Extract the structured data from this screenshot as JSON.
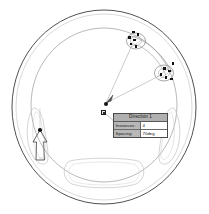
{
  "app": {
    "view_label": "cad-graphics-area",
    "background_color": "#ffffff"
  },
  "callout": {
    "title": "Direction 1",
    "rows": [
      {
        "label": "Instances:",
        "value": "4"
      },
      {
        "label": "Spacing:",
        "value": "70deg"
      }
    ]
  },
  "model": {
    "name": "steering-wheel-part",
    "outer_rim_color": "#3d3d3d",
    "inner_rim_color": "#8e8e8e",
    "grip_color": "#bdbdbd",
    "preview_color": "#9a9a9a",
    "selection_color": "#2d2d2d"
  },
  "icons": {
    "rotation_axis": "rotation-axis-icon",
    "direction_arrow": "direction-arrow-icon",
    "center_point": "center-point-icon"
  }
}
